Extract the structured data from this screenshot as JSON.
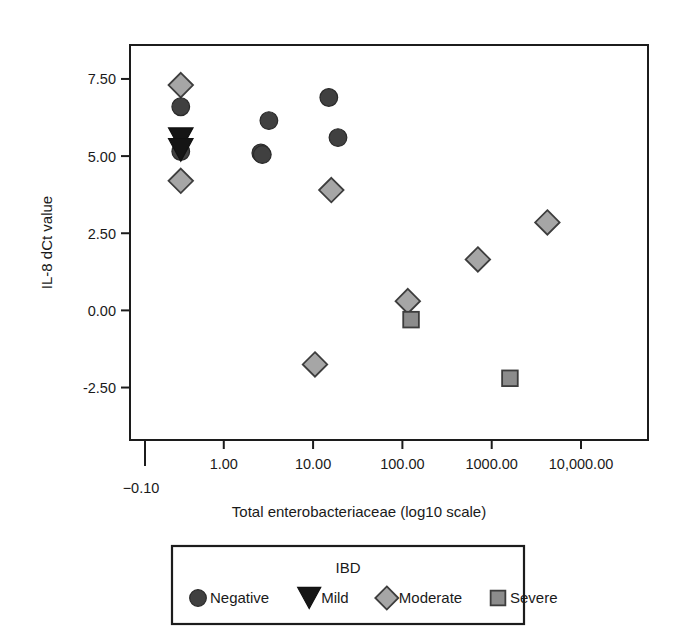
{
  "chart_data": {
    "type": "scatter",
    "title": "",
    "xlabel": "Total enterobacteriaceae (log10 scale)",
    "ylabel": "IL-8 dCt value",
    "grid": false,
    "legend_position": "bottom",
    "legend_title": "IBD",
    "x_scale": "log10",
    "x_tick_labels": [
      "1.00",
      "10.00",
      "100.00",
      "1000.00",
      "10,000.00"
    ],
    "x_tick_values": [
      1,
      10,
      100,
      1000,
      10000
    ],
    "x_origin_tick_label": "-0.10",
    "y_tick_labels": [
      "7.50",
      "5.00",
      "2.50",
      "0.00",
      "-2.50"
    ],
    "y_tick_values": [
      7.5,
      5.0,
      2.5,
      0.0,
      -2.5
    ],
    "ylim": [
      -4.2,
      8.6
    ],
    "xlim_log": [
      -1.05,
      4.75
    ],
    "series": [
      {
        "name": "Negative",
        "marker": "circle",
        "color": "#404040",
        "points": [
          {
            "x": 0.33,
            "y": 6.6
          },
          {
            "x": 0.33,
            "y": 5.15
          },
          {
            "x": 2.6,
            "y": 5.1
          },
          {
            "x": 2.7,
            "y": 5.05
          },
          {
            "x": 3.2,
            "y": 6.15
          },
          {
            "x": 15.0,
            "y": 6.9
          },
          {
            "x": 19.0,
            "y": 5.6
          }
        ]
      },
      {
        "name": "Mild",
        "marker": "triangle-down",
        "color": "#151515",
        "points": [
          {
            "x": 0.33,
            "y": 5.55
          },
          {
            "x": 0.33,
            "y": 5.2
          }
        ]
      },
      {
        "name": "Moderate",
        "marker": "diamond",
        "color": "#a6a6a6",
        "points": [
          {
            "x": 0.33,
            "y": 7.3
          },
          {
            "x": 0.33,
            "y": 4.2
          },
          {
            "x": 16.0,
            "y": 3.9
          },
          {
            "x": 10.5,
            "y": -1.75
          },
          {
            "x": 115.0,
            "y": 0.3
          },
          {
            "x": 700.0,
            "y": 1.65
          },
          {
            "x": 4200.0,
            "y": 2.85
          }
        ]
      },
      {
        "name": "Severe",
        "marker": "square",
        "color": "#8c8c8c",
        "points": [
          {
            "x": 125.0,
            "y": -0.3
          },
          {
            "x": 1600.0,
            "y": -2.2
          }
        ]
      }
    ],
    "legend_entries": [
      {
        "label": "Negative",
        "marker": "circle",
        "color": "#404040"
      },
      {
        "label": "Mild",
        "marker": "triangle-down",
        "color": "#151515"
      },
      {
        "label": "Moderate",
        "marker": "diamond",
        "color": "#a6a6a6"
      },
      {
        "label": "Severe",
        "marker": "square",
        "color": "#8c8c8c"
      }
    ]
  }
}
